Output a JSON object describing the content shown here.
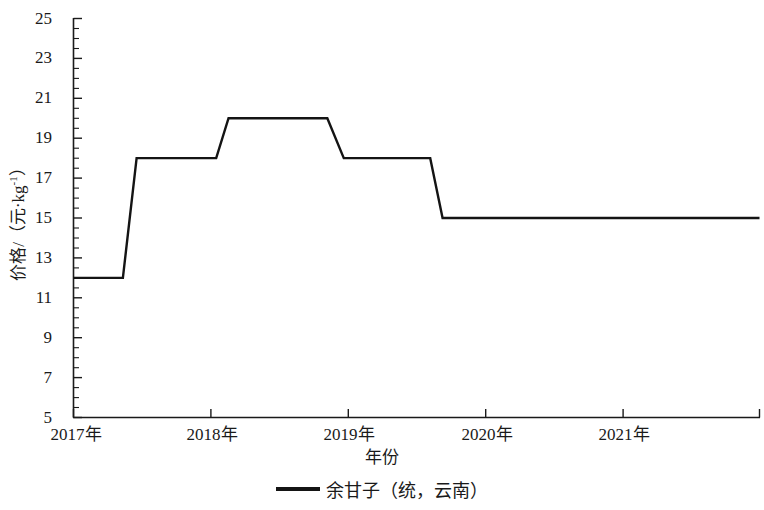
{
  "chart_data": {
    "type": "line",
    "title": "",
    "xlabel": "年份",
    "ylabel": "价格/（元·kg⁻¹）",
    "ylabel_parts": {
      "prefix": "价格/（元·kg",
      "sup": "-1",
      "suffix": "）"
    },
    "legend": [
      {
        "name": "余甘子（统，云南）",
        "color": "#141414"
      }
    ],
    "legend_position": "bottom-center",
    "grid": false,
    "ylim": [
      5,
      25
    ],
    "y_major_step": 2,
    "y_minor_step": 0.5,
    "y_ticks": [
      5,
      7,
      9,
      11,
      13,
      15,
      17,
      19,
      21,
      23,
      25
    ],
    "y_ticklabels": [
      "5",
      "7",
      "9",
      "11",
      "13",
      "15",
      "17",
      "19",
      "21",
      "23",
      "25"
    ],
    "x_ticks": [
      2017,
      2018,
      2019,
      2020,
      2021
    ],
    "x_ticklabels": [
      "2017年",
      "2018年",
      "2019年",
      "2020年",
      "2021年"
    ],
    "xlim": [
      2017,
      2022
    ],
    "series": [
      {
        "name": "余甘子（统，云南）",
        "color": "#141414",
        "linewidth": 2.4,
        "x": [
          2017.0,
          2017.36,
          2017.46,
          2018.04,
          2018.13,
          2018.85,
          2018.97,
          2019.6,
          2019.69,
          2022.0
        ],
        "values": [
          12.0,
          12.0,
          18.0,
          18.0,
          20.0,
          20.0,
          18.0,
          18.0,
          15.0,
          15.0
        ]
      }
    ],
    "annotations": []
  },
  "figure": {
    "background": "#ffffff",
    "axis_color": "#1a1a1a"
  }
}
